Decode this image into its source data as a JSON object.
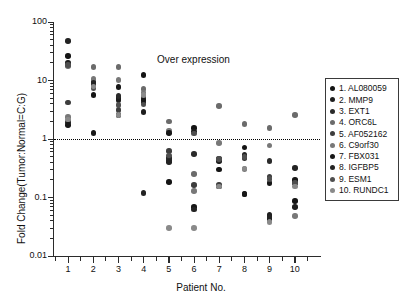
{
  "chart_data": {
    "type": "scatter",
    "title": "",
    "xlabel": "Patient No.",
    "ylabel": "Fold Change(Tumor:Normal=C:G)",
    "yscale": "log",
    "ylim": [
      0.01,
      100
    ],
    "ytick_labels": [
      "100",
      "10",
      "1",
      "0.1",
      "0.01"
    ],
    "ytick_values": [
      100,
      10,
      1,
      0.1,
      0.01
    ],
    "xlim": [
      0.4,
      11.0
    ],
    "categories": [
      "1",
      "2",
      "3",
      "4",
      "5",
      "6",
      "7",
      "8",
      "9",
      "10"
    ],
    "grid": false,
    "legend_position": "right",
    "annotations": [
      {
        "text": "Over expression",
        "x": 6.2,
        "y": 22
      }
    ],
    "reference_lines": [
      {
        "y": 1,
        "style": "dotted",
        "color": "#000000"
      }
    ],
    "series": [
      {
        "name": "1. AL080059",
        "color": "#141414",
        "points": [
          {
            "x": 1,
            "y": 26
          },
          {
            "x": 2,
            "y": 5.7
          },
          {
            "x": 3,
            "y": 5.0
          },
          {
            "x": 4,
            "y": 12.4
          },
          {
            "x": 5,
            "y": 0.185
          },
          {
            "x": 6,
            "y": 1.55
          },
          {
            "x": 7,
            "y": 0.3
          },
          {
            "x": 8,
            "y": 0.72
          },
          {
            "x": 9,
            "y": 0.043
          },
          {
            "x": 10,
            "y": 0.088
          }
        ]
      },
      {
        "name": "2. MMP9",
        "color": "#1e1e1e",
        "points": [
          {
            "x": 1,
            "y": 20
          },
          {
            "x": 2,
            "y": 9.6
          },
          {
            "x": 3,
            "y": 4.6
          },
          {
            "x": 4,
            "y": 2.9
          },
          {
            "x": 5,
            "y": 0.47
          },
          {
            "x": 6,
            "y": 1.35
          },
          {
            "x": 7,
            "y": 0.155
          },
          {
            "x": 8,
            "y": 0.5
          },
          {
            "x": 9,
            "y": 0.05
          },
          {
            "x": 10,
            "y": 0.069
          }
        ]
      },
      {
        "name": "3. EXT1",
        "color": "#2a2a2a",
        "points": [
          {
            "x": 1,
            "y": 1.95
          },
          {
            "x": 2,
            "y": 8.7
          },
          {
            "x": 3,
            "y": 5.4
          },
          {
            "x": 4,
            "y": 4.2
          },
          {
            "x": 5,
            "y": 0.44
          },
          {
            "x": 6,
            "y": 0.55
          },
          {
            "x": 7,
            "y": 0.45
          },
          {
            "x": 8,
            "y": 0.47
          },
          {
            "x": 9,
            "y": 0.42
          },
          {
            "x": 10,
            "y": 0.175
          }
        ]
      },
      {
        "name": "4. ORC6L",
        "color": "#6b6b6b",
        "points": [
          {
            "x": 1,
            "y": 17.5
          },
          {
            "x": 2,
            "y": 17
          },
          {
            "x": 3,
            "y": 17
          },
          {
            "x": 4,
            "y": 7.2
          },
          {
            "x": 5,
            "y": 2.0
          },
          {
            "x": 6,
            "y": 0.255
          },
          {
            "x": 7,
            "y": 3.7
          },
          {
            "x": 8,
            "y": 1.8
          },
          {
            "x": 9,
            "y": 1.55
          },
          {
            "x": 10,
            "y": 2.55
          }
        ]
      },
      {
        "name": "5. AF052162",
        "color": "#3d3d3d",
        "points": [
          {
            "x": 1,
            "y": 4.2
          },
          {
            "x": 2,
            "y": 9.0
          },
          {
            "x": 3,
            "y": 3.1
          },
          {
            "x": 4,
            "y": 5.0
          },
          {
            "x": 5,
            "y": 0.62
          },
          {
            "x": 6,
            "y": 0.165
          },
          {
            "x": 7,
            "y": 0.165
          },
          {
            "x": 8,
            "y": 0.115
          },
          {
            "x": 9,
            "y": 0.23
          },
          {
            "x": 10,
            "y": 0.195
          }
        ]
      },
      {
        "name": "6. C9orf30",
        "color": "#787878",
        "points": [
          {
            "x": 1,
            "y": 2.35
          },
          {
            "x": 2,
            "y": 10.5
          },
          {
            "x": 3,
            "y": 10.2
          },
          {
            "x": 4,
            "y": 6.2
          },
          {
            "x": 5,
            "y": 1.4
          },
          {
            "x": 6,
            "y": 0.128
          },
          {
            "x": 7,
            "y": 0.85
          },
          {
            "x": 8,
            "y": 0.305
          },
          {
            "x": 9,
            "y": 0.78
          },
          {
            "x": 10,
            "y": 0.048
          }
        ]
      },
      {
        "name": "7. FBX031",
        "color": "#171717",
        "points": [
          {
            "x": 1,
            "y": 1.75
          },
          {
            "x": 2,
            "y": 1.28
          },
          {
            "x": 3,
            "y": 7.8
          },
          {
            "x": 4,
            "y": 4.6
          },
          {
            "x": 5,
            "y": 1.28
          },
          {
            "x": 6,
            "y": 0.068
          },
          {
            "x": 7,
            "y": 0.42
          },
          {
            "x": 8,
            "y": 0.115
          },
          {
            "x": 9,
            "y": 0.175
          },
          {
            "x": 10,
            "y": 0.2
          }
        ]
      },
      {
        "name": "8. IGFBP5",
        "color": "#232323",
        "points": [
          {
            "x": 1,
            "y": 47
          },
          {
            "x": 2,
            "y": 9.3
          },
          {
            "x": 3,
            "y": 2.6
          },
          {
            "x": 4,
            "y": 0.118
          },
          {
            "x": 5,
            "y": 0.4
          },
          {
            "x": 6,
            "y": 0.062
          },
          {
            "x": 7,
            "y": 0.44
          },
          {
            "x": 8,
            "y": 0.53
          },
          {
            "x": 9,
            "y": 0.046
          },
          {
            "x": 10,
            "y": 0.32
          }
        ]
      },
      {
        "name": "9. ESM1",
        "color": "#4f4f4f",
        "points": [
          {
            "x": 1,
            "y": 18.5
          },
          {
            "x": 2,
            "y": 7.4
          },
          {
            "x": 3,
            "y": 3.8
          },
          {
            "x": 4,
            "y": 3.9
          },
          {
            "x": 5,
            "y": 0.52
          },
          {
            "x": 6,
            "y": 1.25
          },
          {
            "x": 7,
            "y": 0.46
          },
          {
            "x": 8,
            "y": 0.495
          },
          {
            "x": 9,
            "y": 0.205
          },
          {
            "x": 10,
            "y": 0.175
          }
        ]
      },
      {
        "name": "10. RUNDC1",
        "color": "#8a8a8a",
        "points": [
          {
            "x": 1,
            "y": 2.15
          },
          {
            "x": 2,
            "y": 7.9
          },
          {
            "x": 3,
            "y": 2.55
          },
          {
            "x": 4,
            "y": 5.6
          },
          {
            "x": 5,
            "y": 0.03
          },
          {
            "x": 6,
            "y": 0.03
          },
          {
            "x": 7,
            "y": 0.155
          },
          {
            "x": 8,
            "y": 0.315
          },
          {
            "x": 9,
            "y": 0.038
          },
          {
            "x": 10,
            "y": 0.155
          }
        ]
      }
    ]
  }
}
